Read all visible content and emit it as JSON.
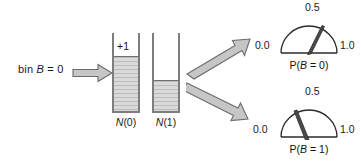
{
  "diagram": {
    "input_label": {
      "prefix": "bin ",
      "variable": "B",
      "suffix": " = 0"
    },
    "bins": [
      {
        "name": "N(0)",
        "caption_prefix": "N",
        "caption_suffix": "(0)",
        "increment_label": "+1",
        "fill_fraction": 0.82
      },
      {
        "name": "N(1)",
        "caption_prefix": "N",
        "caption_suffix": "(1)",
        "increment_label": "",
        "fill_fraction": 0.38
      }
    ],
    "gauges": [
      {
        "name": "P(B=0)",
        "caption_prefix": "P(",
        "caption_variable": "B",
        "caption_suffix": " = 0)",
        "tick_min": "0.0",
        "tick_mid": "0.5",
        "tick_max": "1.0",
        "needle_value": 0.66
      },
      {
        "name": "P(B=1)",
        "caption_prefix": "P(",
        "caption_variable": "B",
        "caption_suffix": " = 1)",
        "tick_min": "0.0",
        "tick_mid": "0.5",
        "tick_max": "1.0",
        "needle_value": 0.34
      }
    ],
    "arrows": [
      {
        "name": "input-arrow",
        "direction": "right"
      },
      {
        "name": "branch-arrow-upper",
        "direction": "up-right"
      },
      {
        "name": "branch-arrow-lower",
        "direction": "down-right"
      }
    ],
    "colors": {
      "ink": "#1a1a1a",
      "arrow_fill": "#c6c6c6",
      "arrow_stroke": "#6b6b6b",
      "bin_fill": "#d0d0d0",
      "bin_stroke": "#7d7d7d"
    }
  }
}
